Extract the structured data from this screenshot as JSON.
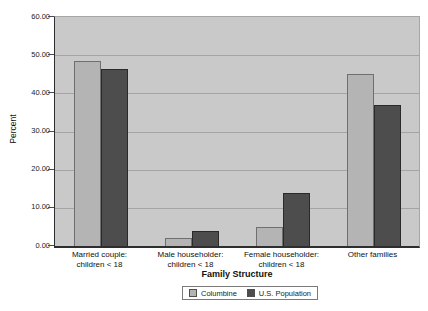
{
  "chart": {
    "y_axis_title": "Percent",
    "x_axis_title": "Family Structure"
  },
  "chart_data": {
    "type": "bar",
    "title": "",
    "xlabel": "Family Structure",
    "ylabel": "Percent",
    "ylim": [
      0,
      60
    ],
    "ytick_interval": 10,
    "y_tick_labels": [
      "60.00",
      "50.00",
      "40.00",
      "30.00",
      "20.00",
      "10.00",
      "0.00"
    ],
    "grid": true,
    "legend_position": "bottom",
    "plot_bg_color": "#c9c9c9",
    "grid_color": "#a4a4a4",
    "categories": [
      "Married couple: children < 18",
      "Male householder: children < 18",
      "Female householder: children < 18",
      "Other families"
    ],
    "categories_display": [
      [
        "Married couple:",
        "children < 18"
      ],
      [
        "Male householder:",
        "children < 18"
      ],
      [
        "Female householder:",
        "children < 18"
      ],
      [
        "Other families"
      ]
    ],
    "series": [
      {
        "name": "Columbine",
        "color": "#b4b4b4",
        "border_color": "#6f6f6f",
        "values": [
          48.6,
          2.2,
          5.0,
          45.2
        ]
      },
      {
        "name": "U.S. Population",
        "color": "#4d4d4d",
        "border_color": "#2a2a2a",
        "values": [
          46.3,
          4.0,
          13.9,
          37.0
        ]
      }
    ]
  }
}
